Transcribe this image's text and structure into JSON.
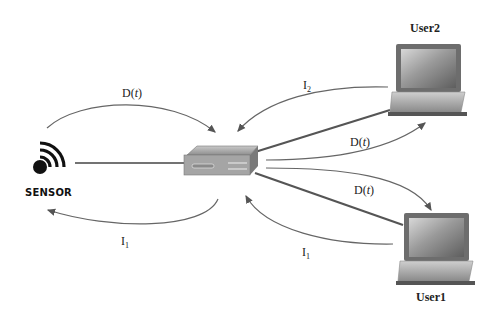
{
  "diagram": {
    "nodes": {
      "sensor": {
        "label": "SENSOR",
        "icon": "wireless-sensor-icon"
      },
      "router": {
        "label": "",
        "icon": "router-icon"
      },
      "user1": {
        "label": "User1",
        "icon": "laptop-icon"
      },
      "user2": {
        "label": "User2",
        "icon": "laptop-icon"
      }
    },
    "edges": [
      {
        "from": "sensor",
        "to": "router",
        "label_main": "D(",
        "label_var": "t",
        "label_end": ")",
        "kind": "curved-arrow"
      },
      {
        "from": "router",
        "to": "sensor",
        "label_main": "I",
        "label_sub": "1",
        "kind": "curved-arrow"
      },
      {
        "from": "user2",
        "to": "router",
        "label_main": "I",
        "label_sub": "2",
        "kind": "curved-arrow"
      },
      {
        "from": "router",
        "to": "user2",
        "label_main": "D(",
        "label_var": "t",
        "label_end": ")",
        "kind": "curved-arrow"
      },
      {
        "from": "router",
        "to": "user1",
        "label_main": "D(",
        "label_var": "t",
        "label_end": ")",
        "kind": "curved-arrow"
      },
      {
        "from": "user1",
        "to": "router",
        "label_main": "I",
        "label_sub": "1",
        "kind": "curved-arrow"
      }
    ],
    "colors": {
      "link": "#555555",
      "arrow": "#666666",
      "laptop_frame": "#6b6b6b",
      "laptop_screen": "#8a8a8a",
      "router_body": "#9a9a9a"
    }
  }
}
